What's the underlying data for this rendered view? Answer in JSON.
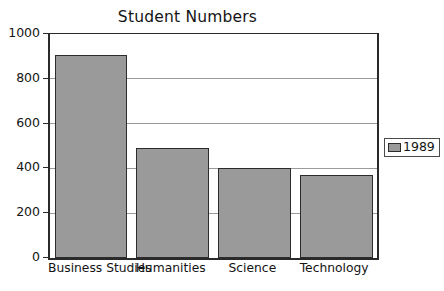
{
  "chart_data": {
    "type": "bar",
    "title": "Student Numbers",
    "xlabel": "",
    "ylabel": "",
    "categories": [
      "Business Studies",
      "Humanities",
      "Science",
      "Technology"
    ],
    "series": [
      {
        "name": "1989",
        "values": [
          905,
          490,
          400,
          370
        ]
      }
    ],
    "ylim": [
      0,
      1000
    ],
    "yticks": [
      0,
      200,
      400,
      600,
      800,
      1000
    ],
    "ytick_labels": [
      "0",
      "200",
      "400",
      "600",
      "800",
      "1000"
    ],
    "grid": true,
    "grid_axis": "y",
    "legend": {
      "position": "right",
      "entries": [
        {
          "label": "1989",
          "color": "#9a9a9a"
        }
      ]
    },
    "colors": {
      "bar_fill": "#9a9a9a",
      "bar_border": "#2c2c2c",
      "axis": "#2a2a2a",
      "gridline": "#9a9a9a",
      "text": "#141414",
      "background": "#ffffff"
    }
  }
}
